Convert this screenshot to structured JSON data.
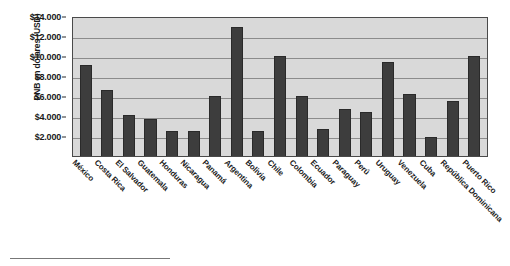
{
  "chart_data": {
    "type": "bar",
    "title": "",
    "xlabel": "",
    "ylabel": "PNB en dólares (USD)",
    "ylim": [
      0,
      14000
    ],
    "grid": true,
    "legend": "none",
    "y_ticks": [
      "$2.000",
      "$4.000",
      "$6.000",
      "$8.000",
      "$10.000",
      "$12.000",
      "$14.000"
    ],
    "y_tick_values": [
      2000,
      4000,
      6000,
      8000,
      10000,
      12000,
      14000
    ],
    "categories": [
      "México",
      "Costa Rica",
      "El Salvador",
      "Guatemala",
      "Honduras",
      "Nicaragua",
      "Panamá",
      "Argentina",
      "Bolivia",
      "Chile",
      "Colombia",
      "Ecuador",
      "Paraguay",
      "Perú",
      "Uruguay",
      "Venezuela",
      "Cuba",
      "República Dominicana",
      "Puerto Rico"
    ],
    "values": [
      9100,
      6600,
      4100,
      3700,
      2500,
      2500,
      6000,
      12900,
      2500,
      10000,
      6000,
      2700,
      4700,
      4400,
      9400,
      6200,
      1900,
      5500,
      10000
    ],
    "bar_color": "#3d3d3d",
    "plot_background": "#d9d9d9",
    "gridline_color": "#8c8c8c",
    "axis_color": "#4a4a4a"
  }
}
